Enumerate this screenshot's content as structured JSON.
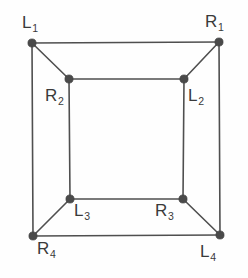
{
  "diagram": {
    "type": "graph-diagram",
    "background_color": "#fefefe",
    "edge_color": "#4f4f4f",
    "vertex_color": "#4a4a4a",
    "label_color": "#3a3a3a",
    "canvas": {
      "width": 248,
      "height": 278
    },
    "vertices": [
      {
        "id": "L1",
        "base": "L",
        "sub": "1",
        "x": 32,
        "y": 43,
        "label_x": 22,
        "label_y": 14,
        "ring": "outer",
        "corner": "top-left"
      },
      {
        "id": "R1",
        "base": "R",
        "sub": "1",
        "x": 219,
        "y": 42,
        "label_x": 205,
        "label_y": 13,
        "ring": "outer",
        "corner": "top-right"
      },
      {
        "id": "R2",
        "base": "R",
        "sub": "2",
        "x": 69,
        "y": 79,
        "label_x": 45,
        "label_y": 87,
        "ring": "inner",
        "corner": "top-left"
      },
      {
        "id": "L2",
        "base": "L",
        "sub": "2",
        "x": 184,
        "y": 79,
        "label_x": 188,
        "label_y": 87,
        "ring": "inner",
        "corner": "top-right"
      },
      {
        "id": "L3",
        "base": "L",
        "sub": "3",
        "x": 70,
        "y": 199,
        "label_x": 74,
        "label_y": 202,
        "ring": "inner",
        "corner": "bottom-left"
      },
      {
        "id": "R3",
        "base": "R",
        "sub": "3",
        "x": 183,
        "y": 199,
        "label_x": 155,
        "label_y": 202,
        "ring": "inner",
        "corner": "bottom-right"
      },
      {
        "id": "R4",
        "base": "R",
        "sub": "4",
        "x": 33,
        "y": 236,
        "label_x": 37,
        "label_y": 240,
        "ring": "outer",
        "corner": "bottom-left"
      },
      {
        "id": "L4",
        "base": "L",
        "sub": "4",
        "x": 220,
        "y": 235,
        "label_x": 200,
        "label_y": 243,
        "ring": "outer",
        "corner": "bottom-right"
      }
    ],
    "edges": [
      {
        "id": "e-outer-top",
        "from": "L1",
        "to": "R1",
        "kind": "outer-square"
      },
      {
        "id": "e-outer-right",
        "from": "R1",
        "to": "L4",
        "kind": "outer-square"
      },
      {
        "id": "e-outer-bottom",
        "from": "L4",
        "to": "R4",
        "kind": "outer-square"
      },
      {
        "id": "e-outer-left",
        "from": "R4",
        "to": "L1",
        "kind": "outer-square"
      },
      {
        "id": "e-inner-top",
        "from": "R2",
        "to": "L2",
        "kind": "inner-square"
      },
      {
        "id": "e-inner-right",
        "from": "L2",
        "to": "R3",
        "kind": "inner-square"
      },
      {
        "id": "e-inner-bottom",
        "from": "R3",
        "to": "L3",
        "kind": "inner-square"
      },
      {
        "id": "e-inner-left",
        "from": "L3",
        "to": "R2",
        "kind": "inner-square"
      },
      {
        "id": "e-diag-tl",
        "from": "L1",
        "to": "R2",
        "kind": "connector"
      },
      {
        "id": "e-diag-tr",
        "from": "R1",
        "to": "L2",
        "kind": "connector"
      },
      {
        "id": "e-diag-bl",
        "from": "R4",
        "to": "L3",
        "kind": "connector"
      },
      {
        "id": "e-diag-br",
        "from": "L4",
        "to": "R3",
        "kind": "connector"
      }
    ]
  }
}
